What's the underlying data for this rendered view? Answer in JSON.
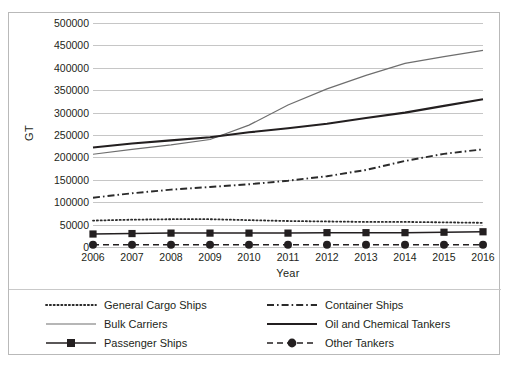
{
  "chart_data": {
    "type": "line",
    "title": "",
    "xlabel": "Year",
    "ylabel": "GT",
    "categories": [
      2006,
      2007,
      2008,
      2009,
      2010,
      2011,
      2012,
      2013,
      2014,
      2015,
      2016
    ],
    "x_tick_labels": [
      "2006",
      "2007",
      "2008",
      "2009",
      "2010",
      "2011",
      "2012",
      "2013",
      "2014",
      "2015",
      "2016"
    ],
    "y_tick_labels": [
      "500000",
      "450000",
      "400000",
      "350000",
      "300000",
      "250000",
      "200000",
      "150000",
      "100000",
      "50000",
      "0"
    ],
    "y_tick_values": [
      500000,
      450000,
      400000,
      350000,
      300000,
      250000,
      200000,
      150000,
      100000,
      50000,
      0
    ],
    "ylim": [
      0,
      500000
    ],
    "grid": true,
    "legend_position": "bottom",
    "series": [
      {
        "name": "General Cargo Ships",
        "style": "dotted",
        "marker": "none",
        "color": "#2b2b2b",
        "values": [
          59000,
          61000,
          62000,
          62000,
          60000,
          58000,
          57000,
          56000,
          56000,
          55000,
          54000
        ]
      },
      {
        "name": "Container Ships",
        "style": "dash-dot",
        "marker": "none",
        "color": "#2b2b2b",
        "values": [
          110000,
          120000,
          128000,
          134000,
          140000,
          148000,
          158000,
          172000,
          192000,
          208000,
          218000
        ]
      },
      {
        "name": "Bulk Carriers",
        "style": "solid-thin",
        "marker": "none",
        "color": "#6e6e6e",
        "values": [
          207000,
          218000,
          228000,
          240000,
          272000,
          317000,
          353000,
          383000,
          410000,
          425000,
          439000
        ]
      },
      {
        "name": "Oil and Chemical Tankers",
        "style": "solid-thick",
        "marker": "none",
        "color": "#231f20",
        "values": [
          222000,
          231000,
          238000,
          245000,
          256000,
          265000,
          275000,
          288000,
          300000,
          315000,
          330000
        ]
      },
      {
        "name": "Passenger Ships",
        "style": "solid-marker",
        "marker": "square",
        "color": "#231f20",
        "values": [
          29000,
          30000,
          31000,
          31000,
          31000,
          31000,
          32000,
          32000,
          32000,
          33000,
          34000
        ]
      },
      {
        "name": "Other Tankers",
        "style": "dashed-marker",
        "marker": "circle",
        "color": "#231f20",
        "values": [
          5000,
          5000,
          5000,
          5000,
          5000,
          5000,
          5000,
          5000,
          5000,
          5000,
          5000
        ]
      }
    ]
  },
  "legend": {
    "column_left": [
      "General Cargo Ships",
      "Bulk Carriers",
      "Passenger Ships"
    ],
    "column_right": [
      "Container Ships",
      "Oil and Chemical Tankers",
      "Other Tankers"
    ]
  },
  "colors": {
    "grid": "#c6c6c6",
    "frame": "#b9b9b9",
    "text": "#231f20",
    "bulk": "#6e6e6e",
    "ink": "#231f20"
  }
}
